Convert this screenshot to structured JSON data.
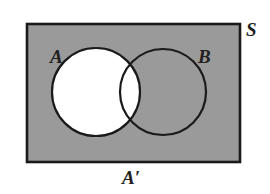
{
  "figure": {
    "universe_label": "S",
    "set_a_label": "A",
    "set_b_label": "B",
    "shaded_region_label": "A′",
    "colors": {
      "shaded_fill": "#9a9a9a",
      "unshaded_fill": "#ffffff",
      "outline": "#1a1a1a",
      "background": "#ffffff",
      "label_color": "#231f20"
    },
    "geometry": {
      "rectangle": {
        "x": 27,
        "y": 24,
        "width": 213,
        "height": 138
      },
      "circle_a": {
        "cx": 96,
        "cy": 92,
        "r": 44
      },
      "circle_b": {
        "cx": 163,
        "cy": 92,
        "r": 43
      }
    },
    "regions": [
      {
        "name": "A only",
        "shaded": false
      },
      {
        "name": "A intersect B",
        "shaded": false
      },
      {
        "name": "B only",
        "shaded": true
      },
      {
        "name": "outside A and B",
        "shaded": true
      }
    ]
  }
}
